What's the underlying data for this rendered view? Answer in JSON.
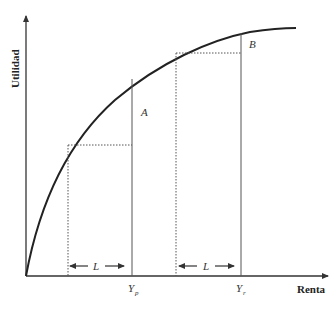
{
  "diagram": {
    "y_axis_label": "Utilidad",
    "x_axis_label": "Renta",
    "region_labels": {
      "a": "A",
      "b": "B"
    },
    "loss_labels": {
      "left": "L",
      "right": "L"
    },
    "tick_labels": {
      "yp_main": "Y",
      "yp_sub": "p",
      "yr_main": "Y",
      "yr_sub": "r"
    },
    "colors": {
      "curve": "#222222",
      "axis": "#333333",
      "guide": "#555555"
    }
  }
}
